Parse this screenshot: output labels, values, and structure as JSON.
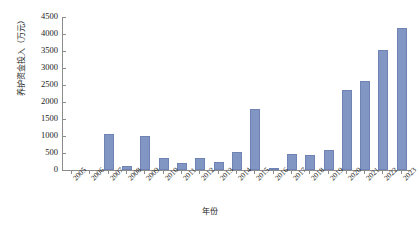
{
  "chart_data": {
    "type": "bar",
    "title": "",
    "xlabel": "年份",
    "ylabel": "养护资金投入（万元）",
    "categories": [
      "2005",
      "2006",
      "2007",
      "2008",
      "2009",
      "2010",
      "2011",
      "2012",
      "2013",
      "2014",
      "2015",
      "2016",
      "2017",
      "2018",
      "2019",
      "2020",
      "2021",
      "2022",
      "2023"
    ],
    "values": [
      0,
      0,
      1070,
      120,
      990,
      340,
      200,
      340,
      230,
      530,
      1800,
      40,
      480,
      450,
      600,
      2350,
      2620,
      3520,
      4170
    ],
    "series": [
      {
        "name": "养护资金投入",
        "values": [
          0,
          0,
          1070,
          120,
          990,
          340,
          200,
          340,
          230,
          530,
          1800,
          40,
          480,
          450,
          600,
          2350,
          2620,
          3520,
          4170
        ]
      }
    ],
    "ylim": [
      0,
      4500
    ],
    "ytick_labels": [
      "0",
      "500",
      "1000",
      "1500",
      "2000",
      "2500",
      "3000",
      "3500",
      "4000",
      "4500"
    ],
    "ytick_values": [
      0,
      500,
      1000,
      1500,
      2000,
      2500,
      3000,
      3500,
      4000,
      4500
    ],
    "grid": false,
    "legend": "none",
    "bar_color": "#8296c4",
    "axis_color": "#8c8c8c"
  }
}
